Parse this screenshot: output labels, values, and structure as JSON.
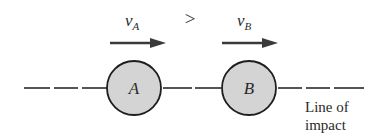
{
  "diagram": {
    "colors": {
      "line": "#2a2a2a",
      "ball_fill": "#d4d4d4",
      "ball_stroke": "#1e1e1e",
      "text": "#2a2a2a",
      "background": "#ffffff"
    },
    "velocity_a": {
      "symbol": "v",
      "subscript": "A"
    },
    "velocity_b": {
      "symbol": "v",
      "subscript": "B"
    },
    "comparison": ">",
    "ball_a": {
      "label": "A"
    },
    "ball_b": {
      "label": "B"
    },
    "line_label": {
      "line1": "Line of",
      "line2": "impact"
    }
  }
}
